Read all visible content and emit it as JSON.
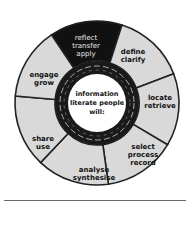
{
  "diagram": {
    "title": "information literate people will:",
    "center_lines": [
      "information",
      "literate people",
      "will:"
    ],
    "colors": {
      "segment_fill": "#d9d9d9",
      "highlight_fill": "#111111",
      "ring_fill": "#1a1a1a",
      "center_fill": "#ffffff",
      "outline": "#222222"
    },
    "segments": [
      {
        "id": "reflect",
        "lines": [
          "reflect",
          "transfer",
          "apply"
        ],
        "highlighted": true
      },
      {
        "id": "define",
        "lines": [
          "define",
          "clarify"
        ],
        "highlighted": false
      },
      {
        "id": "locate",
        "lines": [
          "locate",
          "retrieve"
        ],
        "highlighted": false
      },
      {
        "id": "select",
        "lines": [
          "select",
          "process",
          "record"
        ],
        "highlighted": false
      },
      {
        "id": "analyse",
        "lines": [
          "analyse",
          "synthesise"
        ],
        "highlighted": false
      },
      {
        "id": "share",
        "lines": [
          "share",
          "use"
        ],
        "highlighted": false
      },
      {
        "id": "engage",
        "lines": [
          "engage",
          "grow"
        ],
        "highlighted": false
      }
    ]
  }
}
